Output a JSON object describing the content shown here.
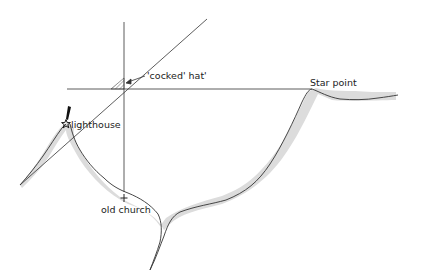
{
  "diagram": {
    "type": "navigation-bearings-map",
    "labels": {
      "cocked_hat": "'cocked' hat'",
      "star_point": "Star point",
      "lighthouse": "lighthouse",
      "old_church": "old church"
    },
    "colors": {
      "line": "#333333",
      "coast_shading": "#d9d9d9",
      "background": "#ffffff"
    }
  }
}
